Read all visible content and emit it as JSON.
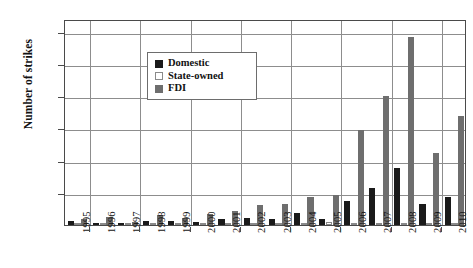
{
  "chart_data": {
    "type": "bar",
    "title": "",
    "xlabel": "",
    "ylabel": "Number of strikes",
    "ylim": [
      0,
      640
    ],
    "yticks": [
      100,
      200,
      300,
      400,
      500,
      600
    ],
    "grid": true,
    "legend_position": "top-left",
    "categories": [
      "1995",
      "1996",
      "1997",
      "1998",
      "1999",
      "2000",
      "2001",
      "2002",
      "2003",
      "2004",
      "2005",
      "2006",
      "2007",
      "2008",
      "2009",
      "2010"
    ],
    "series": [
      {
        "name": "Domestic",
        "color": "#1a1a1a",
        "values": [
          12,
          6,
          5,
          14,
          12,
          10,
          18,
          22,
          20,
          38,
          20,
          75,
          115,
          178,
          65,
          88
        ]
      },
      {
        "name": "State-owned",
        "color": "#ffffff",
        "values": [
          4,
          3,
          2,
          6,
          5,
          4,
          6,
          6,
          5,
          7,
          10,
          6,
          5,
          4,
          3,
          3
        ]
      },
      {
        "name": "FDI",
        "color": "#6e6e6e",
        "values": [
          20,
          24,
          8,
          30,
          22,
          34,
          44,
          62,
          65,
          88,
          92,
          295,
          400,
          585,
          225,
          340
        ]
      }
    ]
  },
  "legend": {
    "items": [
      {
        "label": "Domestic",
        "swatch": "black-square-icon"
      },
      {
        "label": "State-owned",
        "swatch": "white-square-icon"
      },
      {
        "label": "FDI",
        "swatch": "gray-square-icon"
      }
    ]
  }
}
